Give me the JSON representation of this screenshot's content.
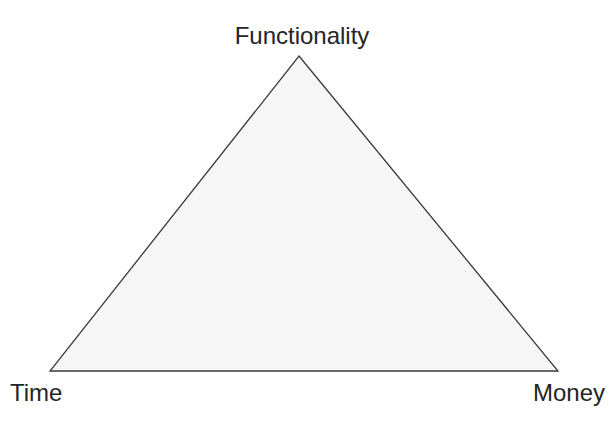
{
  "figure": {
    "background_color": "#ffffff",
    "width": 616,
    "height": 426
  },
  "triangle": {
    "name": "project-triangle",
    "fill_color": "#f6f6f6",
    "stroke_color": "#3a3a3a",
    "stroke_width": 1.3,
    "points": "299,56 558,371 50,371"
  },
  "labels": {
    "apex": "Functionality",
    "bottom_left": "Time",
    "bottom_right": "Money"
  },
  "chart_data": {
    "type": "diagram",
    "diagram_kind": "triangle",
    "title": "",
    "vertices": [
      {
        "label": "Functionality",
        "position": "top",
        "x": 299,
        "y": 56
      },
      {
        "label": "Time",
        "position": "bottom-left",
        "x": 50,
        "y": 371
      },
      {
        "label": "Money",
        "position": "bottom-right",
        "x": 558,
        "y": 371
      }
    ],
    "edges": [
      {
        "from": "Time",
        "to": "Functionality"
      },
      {
        "from": "Functionality",
        "to": "Money"
      },
      {
        "from": "Money",
        "to": "Time"
      }
    ],
    "fill": "#f6f6f6",
    "stroke": "#3a3a3a",
    "legend": [],
    "annotations": []
  }
}
